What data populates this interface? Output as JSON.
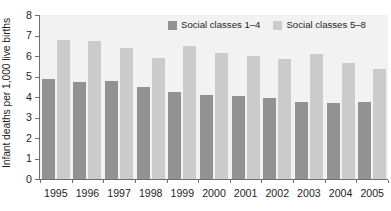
{
  "chart_data": {
    "type": "bar",
    "title": "",
    "subtitle": "",
    "xlabel": "",
    "ylabel": "Infant deaths per 1,000 live births",
    "ylim": [
      0,
      8
    ],
    "ytick_step": 1,
    "ytick_labels": [
      "8",
      "7",
      "6",
      "5",
      "4",
      "3",
      "2",
      "1",
      "0"
    ],
    "grid": false,
    "legend_position": "top-right-inside",
    "categories": [
      "1995",
      "1996",
      "1997",
      "1998",
      "1999",
      "2000",
      "2001",
      "2002",
      "2003",
      "2004",
      "2005"
    ],
    "series": [
      {
        "name": "Social classes 1–4",
        "color": "#929292",
        "values": [
          4.88,
          4.72,
          4.78,
          4.5,
          4.26,
          4.12,
          4.04,
          3.95,
          3.78,
          3.72,
          3.74
        ]
      },
      {
        "name": "Social classes 5–8",
        "color": "#cbcbcb",
        "values": [
          6.8,
          6.75,
          6.38,
          5.92,
          6.51,
          6.16,
          5.99,
          5.85,
          6.1,
          5.66,
          5.37
        ]
      }
    ],
    "colors": {
      "plot_background": "#f2f2f2",
      "axis": "#6d6e71",
      "text": "#231f20",
      "series_1": "#929292",
      "series_2": "#cbcbcb"
    }
  },
  "legend": {
    "items": [
      {
        "label": "Social classes 1–4",
        "swatch": "dark"
      },
      {
        "label": "Social classes 5–8",
        "swatch": "light"
      }
    ]
  }
}
